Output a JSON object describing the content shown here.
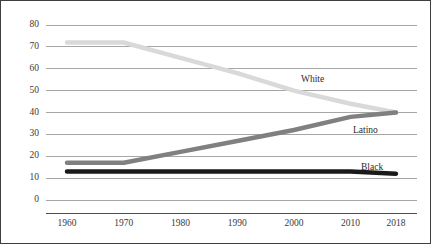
{
  "chart_data": {
    "type": "line",
    "title": "",
    "subtitle": "",
    "xlabel": "",
    "ylabel": "",
    "x": [
      1960,
      1970,
      1980,
      1990,
      2000,
      2010,
      2018
    ],
    "xtick_labels": [
      "1960",
      "1970",
      "1980",
      "1990",
      "2000",
      "2010",
      "2018"
    ],
    "ytick_labels": [
      "0",
      "10",
      "20",
      "30",
      "40",
      "50",
      "60",
      "70",
      "80"
    ],
    "yticks": [
      0,
      10,
      20,
      30,
      40,
      50,
      60,
      70,
      80
    ],
    "ylim": [
      0,
      80
    ],
    "xlim": [
      1960,
      2018
    ],
    "grid": "horizontal",
    "legend_position": "inline-right",
    "series": [
      {
        "name": "White",
        "color": "#d9d9d9",
        "values": [
          72,
          72,
          65,
          58,
          50,
          44,
          40
        ],
        "label": "White",
        "label_x": 300,
        "label_y": 73
      },
      {
        "name": "Latino",
        "color": "#808080",
        "values": [
          17,
          17,
          22,
          27,
          32,
          38,
          40
        ],
        "label": "Latino",
        "label_x": 352,
        "label_y": 124
      },
      {
        "name": "Black",
        "color": "#1a1a1a",
        "values": [
          13,
          13,
          13,
          13,
          13,
          13,
          12
        ],
        "label": "Black",
        "label_x": 360,
        "label_y": 161
      }
    ],
    "axis_color": "#808080",
    "grid_color": "#a6a6a6",
    "border_color": "#3f3f3f",
    "background": "#ffffff"
  }
}
